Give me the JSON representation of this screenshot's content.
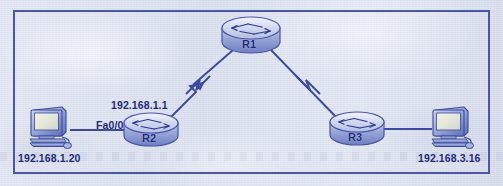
{
  "figure": {
    "kind": "network-topology-diagram",
    "frame_border_color": "#4a57a8",
    "paper_color": "#dde2ef",
    "ink_color": "#1d2a7a",
    "link_color": "#3a4a9e",
    "device_fill_light": "#e8ecf8",
    "device_fill_mid": "#aeb8e0",
    "device_fill_dark": "#6d7cc0"
  },
  "nodes": {
    "r1": {
      "id": "R1",
      "label": "R1",
      "type": "router",
      "icon": "router-icon",
      "x": 250,
      "y": 36
    },
    "r2": {
      "id": "R2",
      "label": "R2",
      "type": "router",
      "icon": "router-icon",
      "x": 150,
      "y": 130,
      "interface_label": "Fa0/0",
      "ip_label": "192.168.1.1"
    },
    "r3": {
      "id": "R3",
      "label": "R3",
      "type": "router",
      "icon": "router-icon",
      "x": 356,
      "y": 129
    },
    "pc_left": {
      "id": "PC1",
      "label": "192.168.1.20",
      "type": "workstation",
      "icon": "desktop-computer-icon",
      "x": 50,
      "y": 127
    },
    "pc_right": {
      "id": "PC2",
      "label": "192.168.3.16",
      "type": "workstation",
      "icon": "desktop-computer-icon",
      "x": 450,
      "y": 127
    }
  },
  "links": [
    {
      "id": "link-pc1-r2",
      "from": "192.168.1.20",
      "to": "R2",
      "media": "ethernet",
      "style": "straight",
      "label": "Fa0/0"
    },
    {
      "id": "link-r2-r1",
      "from": "R2",
      "to": "R1",
      "media": "serial",
      "style": "zigzag"
    },
    {
      "id": "link-r1-r3",
      "from": "R1",
      "to": "R3",
      "media": "serial",
      "style": "zigzag"
    },
    {
      "id": "link-r3-pc2",
      "from": "R3",
      "to": "192.168.3.16",
      "media": "ethernet",
      "style": "straight"
    }
  ],
  "labels": {
    "pc_left_ip": "192.168.1.20",
    "pc_right_ip": "192.168.3.16",
    "r2_fa00": "Fa0/0",
    "r2_ip": "192.168.1.1",
    "r1_name": "R1",
    "r2_name": "R2",
    "r3_name": "R3"
  }
}
